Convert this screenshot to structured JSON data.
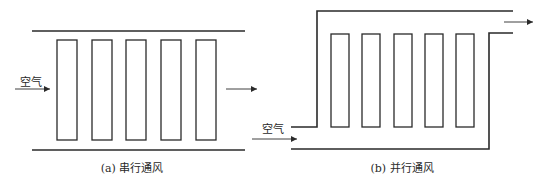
{
  "diagrams": [
    {
      "id": "series",
      "inlet_label": "空气",
      "caption": "(a) 串行通风",
      "channels": 5
    },
    {
      "id": "parallel",
      "inlet_label": "空气",
      "caption": "(b) 并行通风",
      "channels": 5
    }
  ],
  "colors": {
    "stroke": "#2a2a2a",
    "background": "#ffffff"
  }
}
